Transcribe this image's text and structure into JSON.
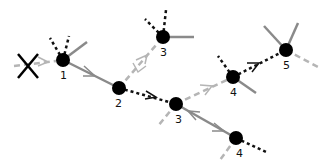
{
  "diagram": {
    "colors": {
      "node": "#000000",
      "solid_edge": "#8a8a8a",
      "dashed_light_edge": "#b5b5b5",
      "dotted_edge": "#111111",
      "cross": "#000000"
    },
    "nodes": [
      {
        "id": "n1",
        "label": "1",
        "x": 63,
        "y": 60
      },
      {
        "id": "n2",
        "label": "2",
        "x": 119,
        "y": 88
      },
      {
        "id": "n3a",
        "label": "3",
        "x": 163,
        "y": 37
      },
      {
        "id": "n3b",
        "label": "3",
        "x": 176,
        "y": 104
      },
      {
        "id": "n4a",
        "label": "4",
        "x": 233,
        "y": 77
      },
      {
        "id": "n4b",
        "label": "4",
        "x": 236,
        "y": 138
      },
      {
        "id": "n5",
        "label": "5",
        "x": 286,
        "y": 50
      }
    ],
    "edges": [
      {
        "from": "n1",
        "to": "n2",
        "style": "solid",
        "arrow": "forward"
      },
      {
        "from": "n2",
        "to": "n3a",
        "style": "dashed-light",
        "arrow": "both"
      },
      {
        "from": "n2",
        "to": "n3b",
        "style": "dotted",
        "arrow": "forward"
      },
      {
        "from": "n3b",
        "to": "n4a",
        "style": "dashed-light",
        "arrow": "forward"
      },
      {
        "from": "n3b",
        "to": "n4b",
        "style": "solid",
        "arrow": "both"
      },
      {
        "from": "n4a",
        "to": "n5",
        "style": "dotted",
        "arrow": "forward"
      }
    ],
    "blocked_entry": {
      "marker": "X",
      "label": "blocked incoming path"
    }
  }
}
